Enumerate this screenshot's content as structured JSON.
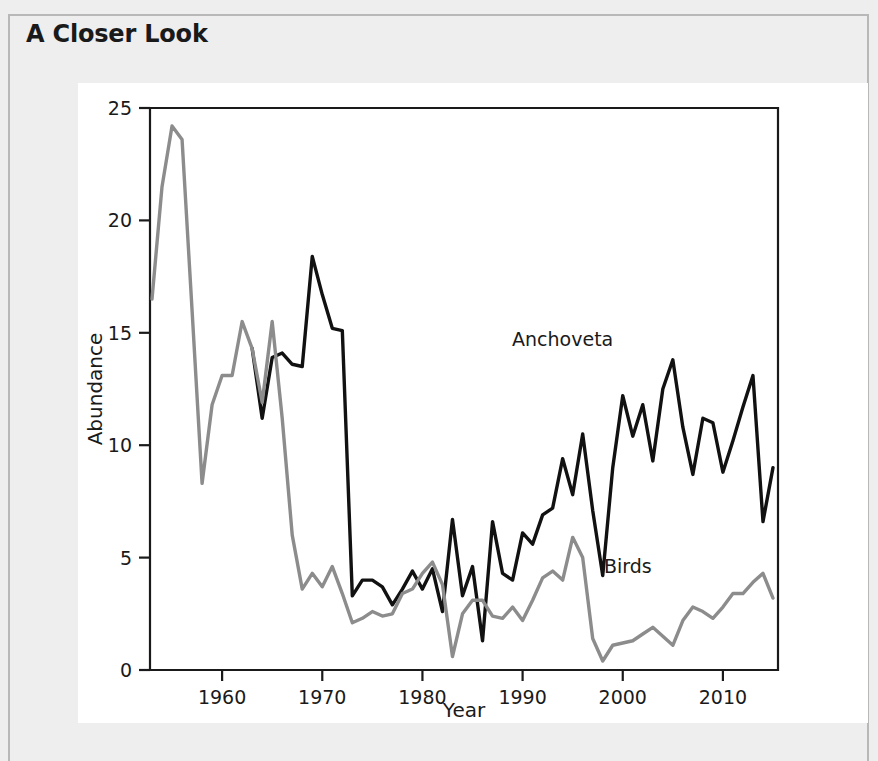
{
  "page": {
    "section_title": "A Closer Look",
    "background_color": "#eeeeee",
    "panel_color": "#ffffff",
    "frame_color": "#b8b8b8"
  },
  "chart_data": {
    "type": "line",
    "title": "",
    "xlabel": "Year",
    "ylabel": "Abundance",
    "xlim": [
      1952.8,
      2015.5
    ],
    "ylim": [
      0,
      25
    ],
    "xticks": [
      1960,
      1970,
      1980,
      1990,
      2000,
      2010
    ],
    "xtick_labels": [
      "1960",
      "1970",
      "1980",
      "1990",
      "2000",
      "2010"
    ],
    "yticks": [
      0,
      5,
      10,
      15,
      20,
      25
    ],
    "ytick_labels": [
      "0",
      "5",
      "10",
      "15",
      "20",
      "25"
    ],
    "grid": false,
    "legend": "inline-annotations",
    "axis_color": "#1a1a1a",
    "series": [
      {
        "name": "Anchoveta",
        "color": "#111111",
        "label_x": 1994.0,
        "label_y": 14.4,
        "x": [
          1963,
          1964,
          1965,
          1966,
          1967,
          1968,
          1969,
          1970,
          1971,
          1972,
          1973,
          1974,
          1975,
          1976,
          1977,
          1978,
          1979,
          1980,
          1981,
          1982,
          1983,
          1984,
          1985,
          1986,
          1987,
          1988,
          1989,
          1990,
          1991,
          1992,
          1993,
          1994,
          1995,
          1996,
          1997,
          1998,
          1999,
          2000,
          2001,
          2002,
          2003,
          2004,
          2005,
          2006,
          2007,
          2008,
          2009,
          2010,
          2011,
          2012,
          2013,
          2014,
          2015
        ],
        "y": [
          14.3,
          11.2,
          13.9,
          14.1,
          13.6,
          13.5,
          18.4,
          16.7,
          15.2,
          15.1,
          3.3,
          4.0,
          4.0,
          3.7,
          2.9,
          3.6,
          4.4,
          3.6,
          4.5,
          2.6,
          6.7,
          3.3,
          4.6,
          1.3,
          6.6,
          4.3,
          4.0,
          6.1,
          5.6,
          6.9,
          7.2,
          9.4,
          7.8,
          10.5,
          7.1,
          4.2,
          9.0,
          12.2,
          10.4,
          11.8,
          9.3,
          12.5,
          13.8,
          10.8,
          8.7,
          11.2,
          11.0,
          8.8,
          10.2,
          11.7,
          13.1,
          6.6,
          9.0
        ]
      },
      {
        "name": "Birds",
        "color": "#8c8c8c",
        "label_x": 2000.5,
        "label_y": 4.3,
        "x": [
          1953,
          1954,
          1955,
          1956,
          1957,
          1958,
          1959,
          1960,
          1961,
          1962,
          1963,
          1964,
          1965,
          1966,
          1967,
          1968,
          1969,
          1970,
          1971,
          1972,
          1973,
          1974,
          1975,
          1976,
          1977,
          1978,
          1979,
          1980,
          1981,
          1982,
          1983,
          1984,
          1985,
          1986,
          1987,
          1988,
          1989,
          1990,
          1991,
          1992,
          1993,
          1994,
          1995,
          1996,
          1997,
          1998,
          1999,
          2000,
          2001,
          2002,
          2003,
          2004,
          2005,
          2006,
          2007,
          2008,
          2009,
          2010,
          2011,
          2012,
          2013,
          2014,
          2015
        ],
        "y": [
          16.5,
          21.5,
          24.2,
          23.6,
          16.0,
          8.3,
          11.8,
          13.1,
          13.1,
          15.5,
          14.3,
          11.9,
          15.5,
          11.2,
          6.0,
          3.6,
          4.3,
          3.7,
          4.6,
          3.4,
          2.1,
          2.3,
          2.6,
          2.4,
          2.5,
          3.4,
          3.6,
          4.3,
          4.8,
          3.8,
          0.6,
          2.5,
          3.1,
          3.1,
          2.4,
          2.3,
          2.8,
          2.2,
          3.1,
          4.1,
          4.4,
          4.0,
          5.9,
          5.0,
          1.4,
          0.4,
          1.1,
          1.2,
          1.3,
          1.6,
          1.9,
          1.5,
          1.1,
          2.2,
          2.8,
          2.6,
          2.3,
          2.8,
          3.4,
          3.4,
          3.9,
          4.3,
          3.2
        ]
      }
    ]
  }
}
